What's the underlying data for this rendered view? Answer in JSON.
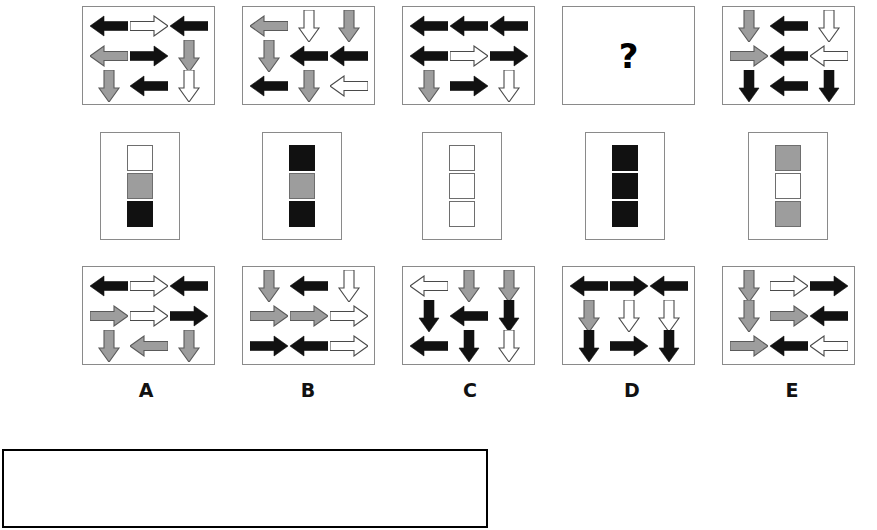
{
  "figure": {
    "kind": "matrix-reasoning-item",
    "question_mark": "?",
    "colors": {
      "black": "#111111",
      "gray": "#9d9d9d",
      "white": "#ffffff",
      "outline": "#6e6e6e",
      "panel_border": "#8a8a8a",
      "answerbox_border": "#000000"
    }
  },
  "top_row": {
    "label": "stimulus-row",
    "panels": [
      {
        "id": "top-1",
        "arrows": [
          {
            "dir": "left",
            "fill": "black"
          },
          {
            "dir": "right",
            "fill": "white"
          },
          {
            "dir": "left",
            "fill": "black"
          },
          {
            "dir": "left",
            "fill": "gray"
          },
          {
            "dir": "right",
            "fill": "black"
          },
          {
            "dir": "down",
            "fill": "gray"
          },
          {
            "dir": "down",
            "fill": "gray"
          },
          {
            "dir": "left",
            "fill": "black"
          },
          {
            "dir": "down",
            "fill": "white"
          }
        ]
      },
      {
        "id": "top-2",
        "arrows": [
          {
            "dir": "left",
            "fill": "gray"
          },
          {
            "dir": "down",
            "fill": "white"
          },
          {
            "dir": "down",
            "fill": "gray"
          },
          {
            "dir": "down",
            "fill": "gray"
          },
          {
            "dir": "left",
            "fill": "black"
          },
          {
            "dir": "left",
            "fill": "black"
          },
          {
            "dir": "left",
            "fill": "black"
          },
          {
            "dir": "down",
            "fill": "gray"
          },
          {
            "dir": "left",
            "fill": "white"
          }
        ]
      },
      {
        "id": "top-3",
        "arrows": [
          {
            "dir": "left",
            "fill": "black"
          },
          {
            "dir": "left",
            "fill": "black"
          },
          {
            "dir": "left",
            "fill": "black"
          },
          {
            "dir": "left",
            "fill": "black"
          },
          {
            "dir": "right",
            "fill": "white"
          },
          {
            "dir": "right",
            "fill": "black"
          },
          {
            "dir": "down",
            "fill": "gray"
          },
          {
            "dir": "right",
            "fill": "black"
          },
          {
            "dir": "down",
            "fill": "white"
          }
        ]
      },
      {
        "id": "top-4",
        "is_question": true,
        "arrows": []
      },
      {
        "id": "top-5",
        "arrows": [
          {
            "dir": "down",
            "fill": "gray"
          },
          {
            "dir": "left",
            "fill": "black"
          },
          {
            "dir": "down",
            "fill": "white"
          },
          {
            "dir": "right",
            "fill": "gray"
          },
          {
            "dir": "left",
            "fill": "black"
          },
          {
            "dir": "left",
            "fill": "white"
          },
          {
            "dir": "down",
            "fill": "black"
          },
          {
            "dir": "left",
            "fill": "black"
          },
          {
            "dir": "down",
            "fill": "black"
          }
        ]
      }
    ]
  },
  "middle_row": {
    "label": "square-strip-row",
    "panels": [
      {
        "id": "mid-1",
        "squares": [
          "white",
          "gray",
          "black"
        ]
      },
      {
        "id": "mid-2",
        "squares": [
          "black",
          "gray",
          "black"
        ]
      },
      {
        "id": "mid-3",
        "squares": [
          "white",
          "white",
          "white"
        ]
      },
      {
        "id": "mid-4",
        "squares": [
          "black",
          "black",
          "black"
        ]
      },
      {
        "id": "mid-5",
        "squares": [
          "gray",
          "white",
          "gray"
        ]
      }
    ]
  },
  "options_row": {
    "label": "answer-options-row",
    "options": [
      {
        "letter": "A",
        "arrows": [
          {
            "dir": "left",
            "fill": "black"
          },
          {
            "dir": "right",
            "fill": "white"
          },
          {
            "dir": "left",
            "fill": "black"
          },
          {
            "dir": "right",
            "fill": "gray"
          },
          {
            "dir": "right",
            "fill": "white"
          },
          {
            "dir": "right",
            "fill": "black"
          },
          {
            "dir": "down",
            "fill": "gray"
          },
          {
            "dir": "left",
            "fill": "gray"
          },
          {
            "dir": "down",
            "fill": "gray"
          }
        ]
      },
      {
        "letter": "B",
        "arrows": [
          {
            "dir": "down",
            "fill": "gray"
          },
          {
            "dir": "left",
            "fill": "black"
          },
          {
            "dir": "down",
            "fill": "white"
          },
          {
            "dir": "right",
            "fill": "gray"
          },
          {
            "dir": "right",
            "fill": "gray"
          },
          {
            "dir": "right",
            "fill": "white"
          },
          {
            "dir": "right",
            "fill": "black"
          },
          {
            "dir": "left",
            "fill": "black"
          },
          {
            "dir": "right",
            "fill": "white"
          }
        ]
      },
      {
        "letter": "C",
        "arrows": [
          {
            "dir": "left",
            "fill": "white"
          },
          {
            "dir": "down",
            "fill": "gray"
          },
          {
            "dir": "down",
            "fill": "gray"
          },
          {
            "dir": "down",
            "fill": "black"
          },
          {
            "dir": "left",
            "fill": "black"
          },
          {
            "dir": "down",
            "fill": "black"
          },
          {
            "dir": "left",
            "fill": "black"
          },
          {
            "dir": "down",
            "fill": "black"
          },
          {
            "dir": "down",
            "fill": "white"
          }
        ]
      },
      {
        "letter": "D",
        "arrows": [
          {
            "dir": "left",
            "fill": "black"
          },
          {
            "dir": "right",
            "fill": "black"
          },
          {
            "dir": "left",
            "fill": "black"
          },
          {
            "dir": "down",
            "fill": "gray"
          },
          {
            "dir": "down",
            "fill": "white"
          },
          {
            "dir": "down",
            "fill": "white"
          },
          {
            "dir": "down",
            "fill": "black"
          },
          {
            "dir": "right",
            "fill": "black"
          },
          {
            "dir": "down",
            "fill": "black"
          }
        ]
      },
      {
        "letter": "E",
        "arrows": [
          {
            "dir": "down",
            "fill": "gray"
          },
          {
            "dir": "right",
            "fill": "white"
          },
          {
            "dir": "right",
            "fill": "black"
          },
          {
            "dir": "down",
            "fill": "gray"
          },
          {
            "dir": "right",
            "fill": "gray"
          },
          {
            "dir": "left",
            "fill": "black"
          },
          {
            "dir": "right",
            "fill": "gray"
          },
          {
            "dir": "left",
            "fill": "black"
          },
          {
            "dir": "left",
            "fill": "white"
          }
        ]
      }
    ]
  },
  "answer_box": {
    "label": "response-area",
    "text": ""
  }
}
